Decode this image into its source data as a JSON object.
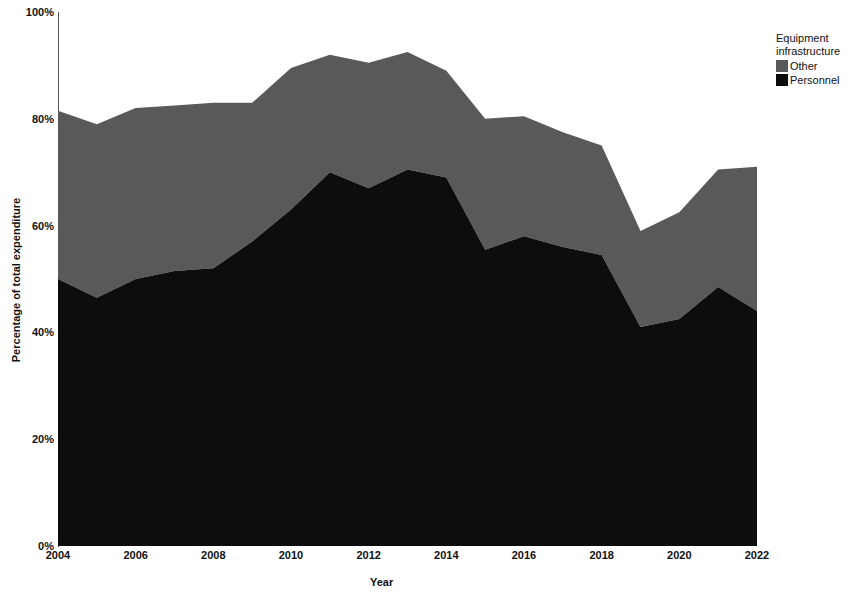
{
  "chart_data": {
    "type": "area",
    "stacked": true,
    "title": "",
    "xlabel": "Year",
    "ylabel": "Percentage of total expenditure",
    "xlim": [
      2004,
      2022
    ],
    "ylim": [
      0,
      100
    ],
    "ytick_labels": [
      "0%",
      "20%",
      "40%",
      "60%",
      "80%",
      "100%"
    ],
    "ytick_values": [
      0,
      20,
      40,
      60,
      80,
      100
    ],
    "xtick_labels": [
      "2004",
      "2006",
      "2008",
      "2010",
      "2012",
      "2014",
      "2016",
      "2018",
      "2020",
      "2022"
    ],
    "xtick_values": [
      2004,
      2006,
      2008,
      2010,
      2012,
      2014,
      2016,
      2018,
      2020,
      2022
    ],
    "grid": false,
    "x": [
      2004,
      2005,
      2006,
      2007,
      2008,
      2009,
      2010,
      2011,
      2012,
      2013,
      2014,
      2015,
      2016,
      2017,
      2018,
      2019,
      2020,
      2021,
      2022
    ],
    "series": [
      {
        "name": "Personnel",
        "color": "#0d0d0d",
        "values": [
          50,
          46.5,
          50,
          51.5,
          52,
          57,
          63,
          70,
          67,
          70.5,
          69,
          55.5,
          58,
          56,
          54.5,
          41,
          42.5,
          48.5,
          44
        ]
      },
      {
        "name": "Other",
        "color": "#595959",
        "values": [
          31.5,
          32.5,
          32,
          31,
          31,
          26,
          26.5,
          22,
          23.5,
          22,
          20,
          24.5,
          22.5,
          21.5,
          20.5,
          18,
          20,
          22,
          27
        ]
      }
    ],
    "totals": [
      81.5,
      79,
      82,
      82.5,
      83,
      83,
      89.5,
      92,
      90.5,
      92.5,
      89,
      80,
      80.5,
      77.5,
      75,
      59,
      62.5,
      70.5,
      71
    ],
    "legend": {
      "position": "right",
      "title": "Equipment infrastructure",
      "title_lines": [
        "Equipment",
        "infrastructure"
      ],
      "entries": [
        {
          "label": "Other",
          "color": "#595959"
        },
        {
          "label": "Personnel",
          "color": "#0d0d0d"
        }
      ]
    }
  },
  "axes": {
    "y_title": "Percentage of total expenditure",
    "x_title": "Year",
    "yticks": [
      {
        "label": "100%",
        "value": 100
      },
      {
        "label": "80%",
        "value": 80
      },
      {
        "label": "60%",
        "value": 60
      },
      {
        "label": "40%",
        "value": 40
      },
      {
        "label": "20%",
        "value": 20
      },
      {
        "label": "0%",
        "value": 0
      }
    ],
    "xticks": [
      {
        "label": "2004",
        "value": 2004
      },
      {
        "label": "2006",
        "value": 2006
      },
      {
        "label": "2008",
        "value": 2008
      },
      {
        "label": "2010",
        "value": 2010
      },
      {
        "label": "2012",
        "value": 2012
      },
      {
        "label": "2014",
        "value": 2014
      },
      {
        "label": "2016",
        "value": 2016
      },
      {
        "label": "2018",
        "value": 2018
      },
      {
        "label": "2020",
        "value": 2020
      },
      {
        "label": "2022",
        "value": 2022
      }
    ]
  },
  "legend": {
    "title_line1": "Equipment",
    "title_line2": "infrastructure",
    "item_other": "Other",
    "item_personnel": "Personnel"
  }
}
